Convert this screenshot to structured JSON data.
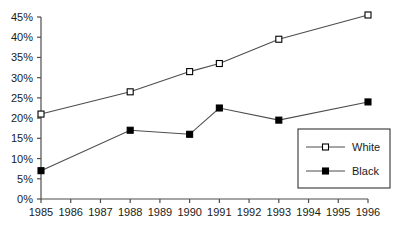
{
  "chart_data": {
    "type": "line",
    "title": "",
    "subtitle": "",
    "xlabel": "",
    "ylabel": "",
    "categories": [
      "1985",
      "1986",
      "1987",
      "1988",
      "1989",
      "1990",
      "1991",
      "1992",
      "1993",
      "1994",
      "1995",
      "1996"
    ],
    "x_tick_labels": [
      "1985",
      "1986",
      "1987",
      "1988",
      "1989",
      "1990",
      "1991",
      "1992",
      "1993",
      "1994",
      "1995",
      "1996"
    ],
    "y_tick_labels": [
      "0%",
      "5%",
      "10%",
      "15%",
      "20%",
      "25%",
      "30%",
      "35%",
      "40%",
      "45%"
    ],
    "y_tick_values": [
      0,
      5,
      10,
      15,
      20,
      25,
      30,
      35,
      40,
      45
    ],
    "ylim": [
      0,
      45
    ],
    "xlim": [
      "1985",
      "1996"
    ],
    "grid": false,
    "legend_position": "bottom-right",
    "series": [
      {
        "name": "White",
        "marker": "open-square",
        "x": [
          "1985",
          "1988",
          "1990",
          "1991",
          "1993",
          "1996"
        ],
        "values": [
          21,
          26.5,
          31.5,
          33.5,
          39.5,
          45.5
        ]
      },
      {
        "name": "Black",
        "marker": "filled-square",
        "x": [
          "1985",
          "1988",
          "1990",
          "1991",
          "1993",
          "1996"
        ],
        "values": [
          7,
          17,
          16,
          22.5,
          19.5,
          24
        ]
      }
    ]
  },
  "legend": {
    "entries": [
      {
        "label": "White"
      },
      {
        "label": "Black"
      }
    ]
  },
  "colors": {
    "axis": "#4d4d4d",
    "line": "#4d4d4d",
    "marker_fill_white": "#ffffff",
    "marker_fill_black": "#000000",
    "text": "#1a1a1a",
    "background": "#ffffff",
    "legend_border": "#333333"
  }
}
